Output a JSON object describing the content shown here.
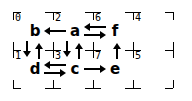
{
  "diagram": {
    "type": "grid-graph",
    "grid": {
      "columns": 5,
      "rows": 3,
      "cell_labels": [
        {
          "id": "0",
          "col": 0,
          "row": 0
        },
        {
          "id": "2",
          "col": 1,
          "row": 0
        },
        {
          "id": "6",
          "col": 2,
          "row": 0
        },
        {
          "id": "4",
          "col": 3,
          "row": 0
        },
        {
          "id": "1",
          "col": 0,
          "row": 1
        },
        {
          "id": "3",
          "col": 1,
          "row": 1
        },
        {
          "id": "7",
          "col": 2,
          "row": 1
        },
        {
          "id": "5",
          "col": 3,
          "row": 1
        }
      ]
    },
    "nodes": [
      {
        "id": "b",
        "label": "b",
        "col": 0,
        "row": 0
      },
      {
        "id": "a",
        "label": "a",
        "col": 1,
        "row": 0
      },
      {
        "id": "f",
        "label": "f",
        "col": 2,
        "row": 0
      },
      {
        "id": "d",
        "label": "d",
        "col": 0,
        "row": 1
      },
      {
        "id": "c",
        "label": "c",
        "col": 1,
        "row": 1
      },
      {
        "id": "e",
        "label": "e",
        "col": 2,
        "row": 1
      }
    ],
    "edges": [
      {
        "from": "a",
        "to": "b"
      },
      {
        "from": "f",
        "to": "a"
      },
      {
        "from": "a",
        "to": "f"
      },
      {
        "from": "b",
        "to": "d"
      },
      {
        "from": "d",
        "to": "b"
      },
      {
        "from": "a",
        "to": "c"
      },
      {
        "from": "c",
        "to": "a"
      },
      {
        "from": "e",
        "to": "f"
      },
      {
        "from": "c",
        "to": "d"
      },
      {
        "from": "d",
        "to": "c"
      },
      {
        "from": "c",
        "to": "e"
      }
    ],
    "colors": {
      "ink": "#000000",
      "background": "#ffffff"
    }
  }
}
